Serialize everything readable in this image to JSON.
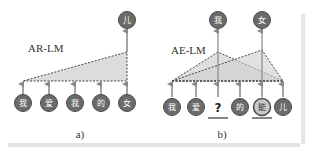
{
  "colors": {
    "node_fill": "#6b6b6b",
    "node_stroke": "#4a4a4a",
    "highlight_fill": "#c8c8c8",
    "triangle_fill": "#d9d9d9",
    "arrow": "#888888",
    "line": "#555555"
  },
  "panel_a": {
    "model_label": "AR-LM",
    "caption": "a)",
    "inputs": [
      "我",
      "爱",
      "我",
      "的",
      "女"
    ],
    "output": "儿"
  },
  "panel_b": {
    "model_label": "AE-LM",
    "caption": "b)",
    "inputs": [
      "我",
      "爱",
      "?",
      "的",
      "能",
      "儿"
    ],
    "outputs": [
      "我",
      "女"
    ],
    "masked_marker": "?",
    "replaced_token": "能"
  }
}
